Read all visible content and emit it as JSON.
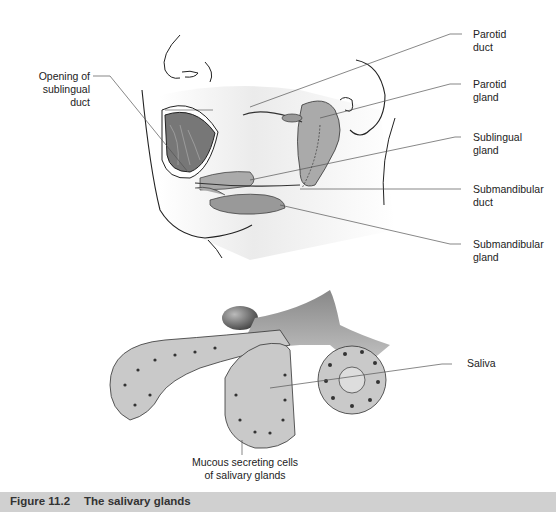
{
  "figure": {
    "caption_number": "Figure 11.2",
    "caption_title": "The salivary glands",
    "caption_bar_color": "#d0d0d0"
  },
  "upper_diagram": {
    "labels": [
      {
        "id": "opening-sublingual-duct",
        "text": [
          "Opening of",
          "sublingual",
          "duct"
        ]
      },
      {
        "id": "parotid-duct",
        "text": [
          "Parotid",
          "duct"
        ]
      },
      {
        "id": "parotid-gland",
        "text": [
          "Parotid",
          "gland"
        ]
      },
      {
        "id": "sublingual-gland",
        "text": [
          "Sublingual",
          "gland"
        ]
      },
      {
        "id": "submandibular-duct",
        "text": [
          "Submandibular",
          "duct"
        ]
      },
      {
        "id": "submandibular-gland",
        "text": [
          "Submandibular",
          "gland"
        ]
      }
    ]
  },
  "lower_diagram": {
    "labels": [
      {
        "id": "saliva",
        "text": [
          "Saliva"
        ]
      },
      {
        "id": "mucous-cells",
        "text": [
          "Mucous secreting cells",
          "of salivary glands"
        ]
      }
    ]
  }
}
